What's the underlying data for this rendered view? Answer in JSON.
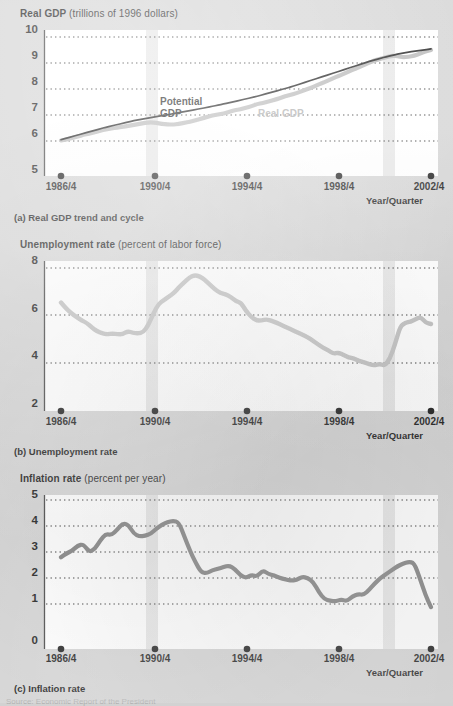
{
  "figure": {
    "background_color": "#d2d2d2",
    "plot_background_color": "#ffffff",
    "real_gdp_color": "#b4b4b4",
    "potential_gdp_color": "#111111",
    "unemployment_color": "#bdbdbd",
    "inflation_color": "#7a7a7a",
    "recession_band_color": "#cfcfcf",
    "gridline_color": "#222222",
    "source_note": "Source: Economic Report of the President"
  },
  "panels": [
    {
      "id": "real-gdp",
      "axis_title_bold": "Real GDP",
      "axis_title_unit": "(trillions of 1996 dollars)",
      "caption": "(a) Real GDP trend and cycle",
      "xaxis_name": "Year/Quarter",
      "yticks": [
        "10",
        "9",
        "8",
        "7",
        "6",
        "5"
      ],
      "xticks": [
        "1986/4",
        "1990/4",
        "1994/4",
        "1998/4",
        "2002/4"
      ],
      "series_labels": [
        {
          "text": "Potential",
          "kind": "potential"
        },
        {
          "text": "GDP",
          "kind": "potential"
        },
        {
          "text": "Real GDP",
          "kind": "real"
        }
      ]
    },
    {
      "id": "unemployment",
      "axis_title_bold": "Unemployment rate",
      "axis_title_unit": "(percent of labor force)",
      "caption": "(b) Unemployment rate",
      "xaxis_name": "Year/Quarter",
      "yticks": [
        "8",
        "6",
        "4",
        "2"
      ],
      "xticks": [
        "1986/4",
        "1990/4",
        "1994/4",
        "1998/4",
        "2002/4"
      ],
      "series_labels": []
    },
    {
      "id": "inflation",
      "axis_title_bold": "Inflation rate",
      "axis_title_unit": "(percent per year)",
      "caption": "(c) Inflation rate",
      "xaxis_name": "Year/Quarter",
      "yticks": [
        "5",
        "4",
        "3",
        "2",
        "1",
        "0"
      ],
      "xticks": [
        "1986/4",
        "1990/4",
        "1994/4",
        "1998/4",
        "2002/4"
      ],
      "series_labels": []
    }
  ],
  "chart_data": [
    {
      "type": "line",
      "panel": "(a) Real GDP trend and cycle",
      "title": "Real GDP (trillions of 1996 dollars)",
      "xlabel": "Year/Quarter",
      "ylabel": "Real GDP (trillions of 1996 dollars)",
      "ylim": [
        5,
        10
      ],
      "yticks": [
        5,
        6,
        7,
        8,
        9,
        10
      ],
      "grid": true,
      "legend_position": "inside-plot",
      "x_start": "1986/4",
      "x_end": "2002/4",
      "x_step_quarters": 1,
      "xtick_labels": [
        "1986/4",
        "1990/4",
        "1994/4",
        "1998/4",
        "2002/4"
      ],
      "recession_bands": [
        [
          "1990/3",
          "1991/1"
        ],
        [
          "2001/1",
          "2001/3"
        ]
      ],
      "series": [
        {
          "name": "Real GDP",
          "color": "#b4b4b4",
          "values": [
            6.02,
            6.06,
            6.12,
            6.17,
            6.24,
            6.28,
            6.33,
            6.4,
            6.45,
            6.48,
            6.52,
            6.55,
            6.58,
            6.62,
            6.66,
            6.7,
            6.72,
            6.7,
            6.66,
            6.64,
            6.63,
            6.66,
            6.7,
            6.74,
            6.8,
            6.86,
            6.92,
            6.98,
            7.02,
            7.06,
            7.12,
            7.18,
            7.22,
            7.28,
            7.34,
            7.42,
            7.46,
            7.52,
            7.58,
            7.64,
            7.72,
            7.78,
            7.84,
            7.92,
            8.0,
            8.08,
            8.18,
            8.26,
            8.36,
            8.46,
            8.54,
            8.64,
            8.74,
            8.82,
            8.92,
            9.02,
            9.1,
            9.16,
            9.22,
            9.28,
            9.26,
            9.22,
            9.24,
            9.28,
            9.36,
            9.44,
            9.5
          ]
        },
        {
          "name": "Potential GDP",
          "color": "#111111",
          "values": [
            6.05,
            6.11,
            6.17,
            6.23,
            6.29,
            6.35,
            6.41,
            6.47,
            6.53,
            6.58,
            6.63,
            6.68,
            6.73,
            6.78,
            6.82,
            6.86,
            6.9,
            6.94,
            6.98,
            7.01,
            7.05,
            7.09,
            7.13,
            7.17,
            7.21,
            7.25,
            7.29,
            7.33,
            7.38,
            7.42,
            7.47,
            7.52,
            7.57,
            7.62,
            7.67,
            7.72,
            7.78,
            7.84,
            7.9,
            7.96,
            8.02,
            8.08,
            8.15,
            8.22,
            8.29,
            8.36,
            8.43,
            8.5,
            8.57,
            8.64,
            8.71,
            8.78,
            8.85,
            8.92,
            8.99,
            9.06,
            9.12,
            9.18,
            9.24,
            9.29,
            9.34,
            9.38,
            9.42,
            9.45,
            9.48,
            9.51,
            9.54
          ]
        }
      ]
    },
    {
      "type": "line",
      "panel": "(b) Unemployment rate",
      "title": "Unemployment rate (percent of labor force)",
      "xlabel": "Year/Quarter",
      "ylabel": "Unemployment rate (percent of labor force)",
      "ylim": [
        2,
        8
      ],
      "yticks": [
        2,
        4,
        6,
        8
      ],
      "grid": true,
      "x_start": "1986/4",
      "x_end": "2002/4",
      "x_step_quarters": 1,
      "xtick_labels": [
        "1986/4",
        "1990/4",
        "1994/4",
        "1998/4",
        "2002/4"
      ],
      "recession_bands": [
        [
          "1990/3",
          "1991/1"
        ],
        [
          "2001/1",
          "2001/3"
        ]
      ],
      "series": [
        {
          "name": "Unemployment rate",
          "color": "#bdbdbd",
          "values": [
            6.55,
            6.3,
            6.1,
            5.95,
            5.8,
            5.7,
            5.5,
            5.35,
            5.25,
            5.22,
            5.25,
            5.22,
            5.22,
            5.35,
            5.28,
            5.25,
            5.3,
            5.6,
            6.1,
            6.5,
            6.65,
            6.8,
            6.95,
            7.2,
            7.4,
            7.6,
            7.7,
            7.65,
            7.5,
            7.3,
            7.1,
            6.95,
            6.9,
            6.8,
            6.6,
            6.55,
            6.2,
            5.95,
            5.8,
            5.8,
            5.85,
            5.78,
            5.7,
            5.6,
            5.5,
            5.4,
            5.3,
            5.2,
            5.1,
            4.95,
            4.8,
            4.65,
            4.55,
            4.4,
            4.45,
            4.35,
            4.25,
            4.2,
            4.1,
            4.05,
            3.95,
            3.92,
            3.98,
            3.9,
            4.2,
            4.8,
            5.55,
            5.7,
            5.75,
            5.85,
            5.95,
            5.7,
            5.65
          ]
        }
      ]
    },
    {
      "type": "line",
      "panel": "(c) Inflation rate",
      "title": "Inflation rate (percent per year)",
      "xlabel": "Year/Quarter",
      "ylabel": "Inflation rate (percent per year)",
      "ylim": [
        0,
        5
      ],
      "yticks": [
        0,
        1,
        2,
        3,
        4,
        5
      ],
      "grid": true,
      "x_start": "1986/4",
      "x_end": "2002/4",
      "x_step_quarters": 1,
      "xtick_labels": [
        "1986/4",
        "1990/4",
        "1994/4",
        "1998/4",
        "2002/4"
      ],
      "recession_bands": [
        [
          "1990/3",
          "1991/1"
        ],
        [
          "2001/1",
          "2001/3"
        ]
      ],
      "series": [
        {
          "name": "Inflation rate",
          "color": "#7a7a7a",
          "values": [
            2.8,
            2.95,
            3.05,
            3.25,
            3.3,
            3.0,
            3.1,
            3.45,
            3.7,
            3.65,
            3.85,
            4.1,
            4.05,
            3.7,
            3.6,
            3.62,
            3.7,
            3.9,
            4.05,
            4.15,
            4.2,
            4.15,
            3.6,
            3.05,
            2.6,
            2.22,
            2.18,
            2.3,
            2.35,
            2.42,
            2.48,
            2.35,
            2.1,
            2.0,
            2.12,
            2.05,
            2.3,
            2.15,
            2.1,
            2.0,
            1.95,
            1.9,
            1.92,
            2.05,
            2.0,
            1.85,
            1.45,
            1.18,
            1.12,
            1.1,
            1.18,
            1.1,
            1.3,
            1.38,
            1.35,
            1.55,
            1.8,
            2.0,
            2.15,
            2.3,
            2.45,
            2.55,
            2.62,
            2.58,
            2.0,
            1.35,
            0.88
          ]
        }
      ]
    }
  ]
}
